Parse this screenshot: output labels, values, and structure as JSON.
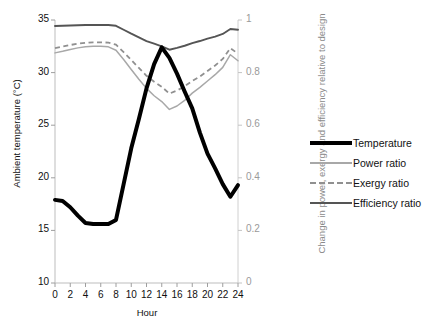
{
  "chart_data": {
    "type": "line",
    "title": "",
    "xlabel": "Hour",
    "ylabel": "Ambient temperature (°C)",
    "y2label": "Change in power, exergy and efficiency relative to design",
    "xlim": [
      0,
      24
    ],
    "ylim": [
      10,
      35
    ],
    "y2lim": [
      0,
      1
    ],
    "xticks": [
      "0",
      "2",
      "4",
      "6",
      "8",
      "10",
      "12",
      "14",
      "16",
      "18",
      "20",
      "22",
      "24"
    ],
    "yticks": [
      "10",
      "15",
      "20",
      "25",
      "30",
      "35"
    ],
    "y2ticks": [
      "0",
      "0.2",
      "0.4",
      "0.6",
      "0.8",
      "1"
    ],
    "grid": false,
    "legend_position": "right",
    "x": [
      0,
      1,
      2,
      3,
      4,
      5,
      6,
      7,
      8,
      9,
      10,
      11,
      12,
      13,
      14,
      15,
      16,
      17,
      18,
      19,
      20,
      21,
      22,
      23,
      24
    ],
    "series": [
      {
        "name": "Temperature",
        "axis": "left",
        "unit": "°C",
        "color": "#000000",
        "style": "solid-thick",
        "values": [
          17.9,
          17.8,
          17.2,
          16.4,
          15.7,
          15.6,
          15.6,
          15.6,
          16.0,
          19.4,
          22.8,
          25.6,
          28.5,
          30.8,
          32.4,
          31.4,
          29.9,
          28.2,
          26.6,
          24.3,
          22.3,
          20.9,
          19.4,
          18.2,
          19.3
        ]
      },
      {
        "name": "Power ratio",
        "axis": "right",
        "unit": "",
        "color": "#a8a8a8",
        "style": "solid-thin",
        "values": [
          0.875,
          0.881,
          0.888,
          0.894,
          0.898,
          0.9,
          0.9,
          0.898,
          0.885,
          0.85,
          0.812,
          0.775,
          0.74,
          0.712,
          0.69,
          0.66,
          0.673,
          0.694,
          0.722,
          0.744,
          0.768,
          0.792,
          0.82,
          0.868,
          0.845
        ]
      },
      {
        "name": "Exergy ratio",
        "axis": "right",
        "unit": "",
        "color": "#909090",
        "style": "dashed",
        "values": [
          0.893,
          0.899,
          0.905,
          0.91,
          0.913,
          0.915,
          0.915,
          0.914,
          0.906,
          0.878,
          0.848,
          0.818,
          0.788,
          0.765,
          0.746,
          0.72,
          0.732,
          0.748,
          0.768,
          0.785,
          0.806,
          0.827,
          0.852,
          0.893,
          0.872
        ]
      },
      {
        "name": "Efficiency ratio",
        "axis": "right",
        "unit": "",
        "color": "#555555",
        "style": "solid-medium",
        "values": [
          0.977,
          0.978,
          0.979,
          0.98,
          0.981,
          0.981,
          0.981,
          0.981,
          0.978,
          0.963,
          0.948,
          0.934,
          0.92,
          0.91,
          0.9,
          0.887,
          0.894,
          0.902,
          0.912,
          0.92,
          0.929,
          0.937,
          0.947,
          0.966,
          0.963
        ]
      }
    ]
  },
  "legend": {
    "items": [
      {
        "label": "Temperature",
        "key": "temp"
      },
      {
        "label": "Power ratio",
        "key": "power"
      },
      {
        "label": "Exergy ratio",
        "key": "exergy"
      },
      {
        "label": "Efficiency ratio",
        "key": "eff"
      }
    ]
  }
}
